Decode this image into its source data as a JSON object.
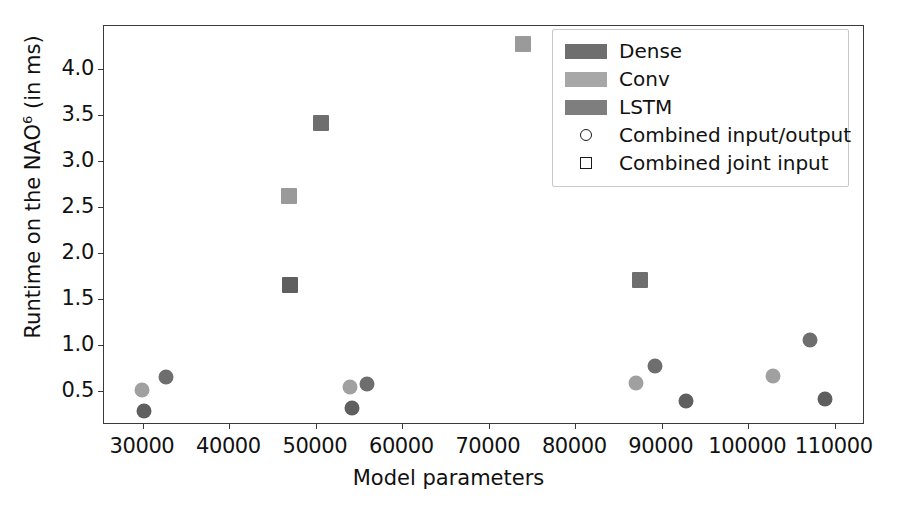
{
  "chart_data": {
    "type": "scatter",
    "title": "",
    "xlabel": "Model parameters",
    "ylabel": "Runtime on the NAO6 (in ms)",
    "ylabel_base": "Runtime on the NAO",
    "ylabel_sup": "6",
    "ylabel_tail": " (in ms)",
    "xlim": [
      25500,
      113500
    ],
    "ylim": [
      0.13,
      4.47
    ],
    "grid": false,
    "legend_position": "upper right",
    "xticks": [
      30000,
      40000,
      50000,
      60000,
      70000,
      80000,
      90000,
      100000,
      110000
    ],
    "xtick_labels": [
      "30000",
      "40000",
      "50000",
      "60000",
      "70000",
      "80000",
      "90000",
      "100000",
      "110000"
    ],
    "yticks": [
      0.5,
      1.0,
      1.5,
      2.0,
      2.5,
      3.0,
      3.5,
      4.0
    ],
    "ytick_labels": [
      "0.5",
      "1.0",
      "1.5",
      "2.0",
      "2.5",
      "3.0",
      "3.5",
      "4.0"
    ],
    "colors": {
      "dense": "#6e6e6e",
      "conv": "#a0a0a0",
      "lstm": "#7e7e7e"
    },
    "series": [
      {
        "name": "Dense",
        "marker": "circle",
        "color": "#6e6e6e",
        "points": [
          {
            "x": 32700,
            "y": 0.65
          },
          {
            "x": 55900,
            "y": 0.58
          },
          {
            "x": 89200,
            "y": 0.77
          },
          {
            "x": 107100,
            "y": 1.06
          }
        ]
      },
      {
        "name": "Conv",
        "marker": "circle",
        "color": "#a0a0a0",
        "points": [
          {
            "x": 29900,
            "y": 0.51
          },
          {
            "x": 54000,
            "y": 0.54
          },
          {
            "x": 87000,
            "y": 0.59
          },
          {
            "x": 102900,
            "y": 0.66
          }
        ]
      },
      {
        "name": "LSTM",
        "marker": "circle",
        "color": "#5f5f5f",
        "points": [
          {
            "x": 30100,
            "y": 0.28
          },
          {
            "x": 54200,
            "y": 0.32
          },
          {
            "x": 92800,
            "y": 0.39
          },
          {
            "x": 108900,
            "y": 0.41
          }
        ]
      },
      {
        "name": "Dense joint",
        "marker": "square",
        "color": "#6e6e6e",
        "points": [
          {
            "x": 50600,
            "y": 3.41
          },
          {
            "x": 87500,
            "y": 1.71
          }
        ]
      },
      {
        "name": "Conv joint",
        "marker": "square",
        "color": "#9a9a9a",
        "points": [
          {
            "x": 46900,
            "y": 2.62
          },
          {
            "x": 74000,
            "y": 4.27
          }
        ]
      },
      {
        "name": "LSTM joint",
        "marker": "square",
        "color": "#5f5f5f",
        "points": [
          {
            "x": 47000,
            "y": 1.65
          }
        ]
      }
    ]
  },
  "legend": {
    "entries": [
      {
        "label": "Dense",
        "key": "swatch",
        "color": "#6e6e6e"
      },
      {
        "label": "Conv",
        "key": "swatch",
        "color": "#a7a7a7"
      },
      {
        "label": "LSTM",
        "key": "swatch",
        "color": "#7e7e7e"
      },
      {
        "label": "Combined input/output",
        "key": "circle",
        "color": "#1a1a1a"
      },
      {
        "label": "Combined joint input",
        "key": "square",
        "color": "#1a1a1a"
      }
    ]
  }
}
